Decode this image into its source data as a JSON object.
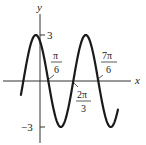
{
  "chart_data": {
    "type": "line",
    "title": "",
    "function": "y = 3cos(2x + π/6)",
    "xlabel": "x",
    "ylabel": "y",
    "y_ticks": [
      {
        "value": 3,
        "label": "3"
      },
      {
        "value": -3,
        "label": "-3"
      }
    ],
    "x_annotations": [
      {
        "value": 0.5236,
        "num": "π",
        "den": "6"
      },
      {
        "value": 2.0944,
        "num": "2π",
        "den": "3"
      },
      {
        "value": 3.6652,
        "num": "7π",
        "den": "6"
      }
    ],
    "series": [
      {
        "name": "curve",
        "x": [
          -1.2,
          -0.2618,
          0.5236,
          1.309,
          2.0944,
          2.8798,
          3.6652,
          4.4506,
          4.9
        ],
        "y": [
          -2.9,
          3,
          0,
          -3,
          0,
          3,
          0,
          -3,
          -1.4
        ]
      }
    ],
    "amplitude": 3,
    "period": "π",
    "xlim": [
      -2.5,
      5.5
    ],
    "ylim": [
      -3.6,
      3.6
    ],
    "grid": false,
    "colors": {
      "curve": "#1a1a1a",
      "axis": "#333333"
    }
  },
  "labels": {
    "x_axis": "x",
    "y_axis": "y",
    "y_pos": "3",
    "y_neg": "−3",
    "pi6_num": "π",
    "pi6_den": "6",
    "twopi3_num": "2π",
    "twopi3_den": "3",
    "sevenpi6_num": "7π",
    "sevenpi6_den": "6"
  }
}
